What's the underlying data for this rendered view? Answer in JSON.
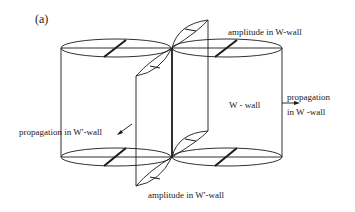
{
  "figure": {
    "panel_label": "(a)",
    "labels": {
      "amplitude_w": "amplitude in W-wall",
      "w_wall": "W - wall",
      "propagation_w_line1": "propagation",
      "propagation_w_line2": "in W -wall",
      "propagation_wprime": "propagation in W'-wall",
      "amplitude_wprime": "amplitude in W'-wall"
    },
    "colors": {
      "line": "#1a1a1a",
      "background": "#ffffff"
    }
  }
}
